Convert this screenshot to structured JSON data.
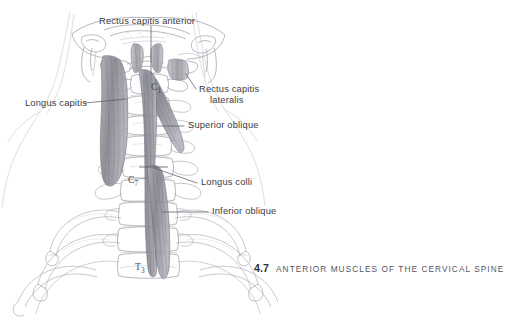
{
  "figure": {
    "kind": "anatomical-illustration",
    "style": "graphite pencil line drawing with grey muscle shading",
    "view": "anterior view of the cervical spine, skull base, ribcage and clavicles",
    "caption": {
      "number": "4.7",
      "title": "ANTERIOR MUSCLES OF THE CERVICAL SPINE"
    },
    "colors": {
      "background": "#ffffff",
      "line_art": "#9b9ba4",
      "line_art_dark": "#6d6d78",
      "muscle_fill": "#8f8f98",
      "muscle_fill_light": "#a9a9b2",
      "label_text": "#3a3a42",
      "leader_line": "#5b5b66",
      "caption_number": "#2e2e36",
      "caption_text": "#55555e"
    }
  },
  "labels": [
    {
      "id": "rectus-capitis-anterior",
      "text": "Rectus capitis anterior",
      "lines": [
        "Rectus capitis anterior"
      ]
    },
    {
      "id": "rectus-capitis-lateralis",
      "text": "Rectus capitis lateralis",
      "lines": [
        "Rectus capitis",
        "lateralis"
      ]
    },
    {
      "id": "longus-capitis",
      "text": "Longus capitis",
      "lines": [
        "Longus capitis"
      ]
    },
    {
      "id": "superior-oblique",
      "text": "Superior oblique",
      "lines": [
        "Superior oblique"
      ]
    },
    {
      "id": "longus-colli",
      "text": "Longus colli",
      "lines": [
        "Longus colli"
      ]
    },
    {
      "id": "inferior-oblique",
      "text": "Inferior oblique",
      "lines": [
        "Inferior oblique"
      ]
    }
  ],
  "label_text": {
    "rectus_capitis_anterior": "Rectus capitis anterior",
    "rectus_capitis_lateralis_l1": "Rectus capitis",
    "rectus_capitis_lateralis_l2": "lateralis",
    "longus_capitis": "Longus capitis",
    "superior_oblique": "Superior oblique",
    "longus_colli": "Longus colli",
    "inferior_oblique": "Inferior oblique"
  },
  "vertebra_markers": [
    {
      "id": "c1",
      "label": "C1",
      "letter": "C",
      "number": "1"
    },
    {
      "id": "c7",
      "label": "C7",
      "letter": "C",
      "number": "7"
    },
    {
      "id": "t3",
      "label": "T3",
      "letter": "T",
      "number": "3"
    }
  ],
  "vertebra_text": {
    "c1_letter": "C",
    "c1_number": "1",
    "c7_letter": "C",
    "c7_number": "7",
    "t3_letter": "T",
    "t3_number": "3"
  },
  "anatomy_parts": [
    "occiput / skull base",
    "mandible rami",
    "atlas (C1)",
    "cervical vertebrae C1-C7",
    "thoracic vertebrae T1-T3",
    "first three ribs (cut)",
    "clavicles (cut)",
    "rectus capitis anterior muscle",
    "rectus capitis lateralis muscle",
    "longus capitis muscle",
    "longus colli muscle - superior oblique part",
    "longus colli muscle - vertical part",
    "longus colli muscle - inferior oblique part"
  ]
}
